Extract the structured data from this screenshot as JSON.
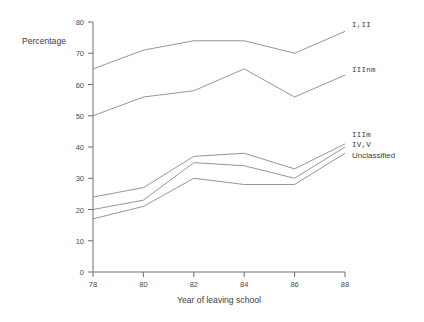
{
  "chart_data": {
    "type": "line",
    "title": "",
    "xlabel": "Year of leaving school",
    "ylabel": "Percentage",
    "x": [
      78,
      80,
      82,
      84,
      86,
      88
    ],
    "xtick_labels": [
      "78",
      "80",
      "82",
      "84",
      "86",
      "88"
    ],
    "ytick_labels": [
      "0",
      "10",
      "20",
      "30",
      "40",
      "50",
      "60",
      "70",
      "80"
    ],
    "ylim": [
      0,
      80
    ],
    "xlim": [
      78,
      88
    ],
    "grid": false,
    "legend_position": "right-inline-end-of-line",
    "series": [
      {
        "name": "I,II",
        "values": [
          65,
          71,
          74,
          74,
          70,
          77
        ]
      },
      {
        "name": "IIInm",
        "values": [
          50,
          56,
          58,
          65,
          56,
          63
        ]
      },
      {
        "name": "IIIm",
        "values": [
          24,
          27,
          37,
          38,
          33,
          41
        ]
      },
      {
        "name": "IV,V",
        "values": [
          20,
          23,
          35,
          34,
          30,
          40
        ]
      },
      {
        "name": "Unclassified",
        "values": [
          17,
          21,
          30,
          28,
          28,
          38
        ]
      }
    ]
  },
  "labels": {
    "ylabel": "Percentage",
    "xlabel": "Year of leaving school",
    "series": [
      "I,II",
      "IIInm",
      "IIIm",
      "IV,V",
      "Unclassified"
    ],
    "yticks": [
      "0",
      "10",
      "20",
      "30",
      "40",
      "50",
      "60",
      "70",
      "80"
    ],
    "xticks": [
      "78",
      "80",
      "82",
      "84",
      "86",
      "88"
    ]
  },
  "colors": {
    "line": "#8a8a8a",
    "axis": "#6e6e6e",
    "text": "#3d3d3d",
    "background": "#ffffff"
  }
}
